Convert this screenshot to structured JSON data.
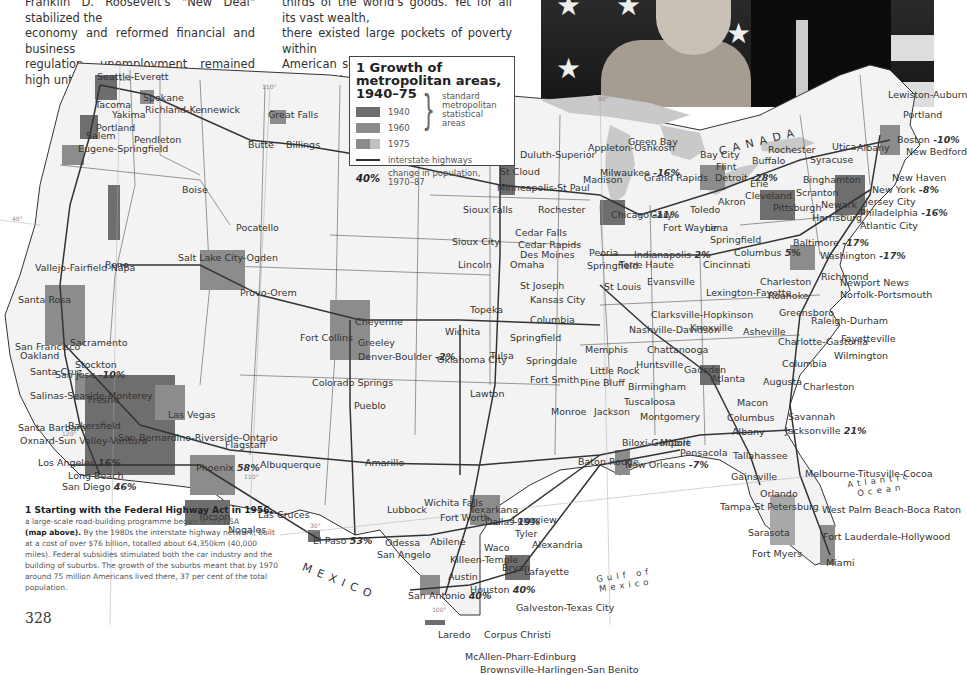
{
  "body_text": {
    "col1": [
      "Franklin D. Roosevelt's \"New Deal\" stabilized the",
      "economy and reformed financial and business",
      "regulation, unemployment remained high until the"
    ],
    "col2": [
      "thirds of the world's goods. Yet for all its vast wealth,",
      "there existed large pockets of poverty within",
      "American society itself. While much of this poverty"
    ]
  },
  "photo": {
    "description": "Couple waving in front of star-spangled flag"
  },
  "legend": {
    "title": "1 Growth of metropolitan areas, 1940–75",
    "items": [
      {
        "label": "1940",
        "color": "#6e6e6e"
      },
      {
        "label": "1960",
        "color": "#8c8c8c"
      },
      {
        "label": "1975",
        "color": "#a8a8a8"
      }
    ],
    "group_label": "standard metropolitan statistical areas",
    "highway_label": "interstate highways",
    "pct_symbol": "40%",
    "pct_label": "change in population, 1970–87"
  },
  "map": {
    "countries": {
      "canada": "CANADA",
      "mexico": "MEXICO"
    },
    "seas": {
      "atlantic": "Atlantic Ocean",
      "gulf": "Gulf of Mexico"
    },
    "meridians": [
      "120°",
      "110°",
      "90°",
      "70°",
      "40°",
      "30°",
      "100°"
    ],
    "cities": [
      {
        "name": "Seattle-Everett",
        "x": 97,
        "y": 17
      },
      {
        "name": "Spokane",
        "x": 143,
        "y": 38
      },
      {
        "name": "Great Falls",
        "x": 268,
        "y": 55
      },
      {
        "name": "Tacoma",
        "x": 95,
        "y": 45
      },
      {
        "name": "Yakima",
        "x": 112,
        "y": 55
      },
      {
        "name": "Richland-Kennewick",
        "x": 145,
        "y": 50
      },
      {
        "name": "Portland",
        "x": 96,
        "y": 68
      },
      {
        "name": "Salem",
        "x": 86,
        "y": 76
      },
      {
        "name": "Pendleton",
        "x": 134,
        "y": 80
      },
      {
        "name": "Butte",
        "x": 248,
        "y": 85
      },
      {
        "name": "Billings",
        "x": 286,
        "y": 85
      },
      {
        "name": "Eugene-Springfield",
        "x": 78,
        "y": 89
      },
      {
        "name": "Boise",
        "x": 182,
        "y": 130
      },
      {
        "name": "Pocatello",
        "x": 236,
        "y": 168
      },
      {
        "name": "Reno",
        "x": 105,
        "y": 205
      },
      {
        "name": "Vallejo-Fairfield-Napa",
        "x": 35,
        "y": 208
      },
      {
        "name": "Salt Lake City-Ogden",
        "x": 178,
        "y": 198
      },
      {
        "name": "Provo-Orem",
        "x": 240,
        "y": 233
      },
      {
        "name": "Santa Rosa",
        "x": 18,
        "y": 240
      },
      {
        "name": "San Francisco",
        "x": 15,
        "y": 287
      },
      {
        "name": "Sacramento",
        "x": 70,
        "y": 283
      },
      {
        "name": "Oakland",
        "x": 20,
        "y": 296
      },
      {
        "name": "Stockton",
        "x": 75,
        "y": 305
      },
      {
        "name": "Santa Cruz",
        "x": 30,
        "y": 312
      },
      {
        "name": "San Jose",
        "x": 55,
        "y": 315,
        "pct": "-10%"
      },
      {
        "name": "Fresno",
        "x": 88,
        "y": 340
      },
      {
        "name": "Salinas-Seaside-Monterey",
        "x": 30,
        "y": 336
      },
      {
        "name": "Las Vegas",
        "x": 168,
        "y": 355
      },
      {
        "name": "Bakersfield",
        "x": 68,
        "y": 366
      },
      {
        "name": "Santa Barbara",
        "x": 18,
        "y": 368
      },
      {
        "name": "Oxnard-Sun Valley-Ventura",
        "x": 20,
        "y": 381
      },
      {
        "name": "San Bernardino-Riverside-Ontario",
        "x": 118,
        "y": 378
      },
      {
        "name": "Los Angeles",
        "x": 38,
        "y": 403,
        "pct": "16%"
      },
      {
        "name": "Long Beach",
        "x": 68,
        "y": 416
      },
      {
        "name": "San Diego",
        "x": 62,
        "y": 427,
        "pct": "46%"
      },
      {
        "name": "Flagstaff",
        "x": 225,
        "y": 385
      },
      {
        "name": "Albuquerque",
        "x": 260,
        "y": 405
      },
      {
        "name": "Phoenix",
        "x": 196,
        "y": 408,
        "pct": "58%"
      },
      {
        "name": "Tucson",
        "x": 198,
        "y": 457
      },
      {
        "name": "Nogales",
        "x": 228,
        "y": 470
      },
      {
        "name": "Las Cruces",
        "x": 258,
        "y": 455
      },
      {
        "name": "El Paso",
        "x": 313,
        "y": 481,
        "pct": "53%"
      },
      {
        "name": "Cheyenne",
        "x": 355,
        "y": 262
      },
      {
        "name": "Fort Collins",
        "x": 300,
        "y": 278
      },
      {
        "name": "Greeley",
        "x": 358,
        "y": 283
      },
      {
        "name": "Denver-Boulder",
        "x": 358,
        "y": 297,
        "pct": "-2%"
      },
      {
        "name": "Colorado Springs",
        "x": 312,
        "y": 323
      },
      {
        "name": "Pueblo",
        "x": 354,
        "y": 346
      },
      {
        "name": "Amarillo",
        "x": 365,
        "y": 403
      },
      {
        "name": "Lubbock",
        "x": 387,
        "y": 450
      },
      {
        "name": "Wichita Falls",
        "x": 424,
        "y": 443
      },
      {
        "name": "Odessa",
        "x": 385,
        "y": 483
      },
      {
        "name": "San Angelo",
        "x": 377,
        "y": 495
      },
      {
        "name": "Abilene",
        "x": 430,
        "y": 482
      },
      {
        "name": "Fort Worth",
        "x": 440,
        "y": 458
      },
      {
        "name": "Dallas",
        "x": 485,
        "y": 462,
        "pct": "19%"
      },
      {
        "name": "Texarkana",
        "x": 470,
        "y": 450
      },
      {
        "name": "Longview",
        "x": 512,
        "y": 460
      },
      {
        "name": "Tyler",
        "x": 515,
        "y": 474
      },
      {
        "name": "Waco",
        "x": 484,
        "y": 488
      },
      {
        "name": "Killeen-Temple",
        "x": 450,
        "y": 500
      },
      {
        "name": "Bryan",
        "x": 502,
        "y": 508
      },
      {
        "name": "Austin",
        "x": 448,
        "y": 517
      },
      {
        "name": "Alexandria",
        "x": 532,
        "y": 485
      },
      {
        "name": "Lafayette",
        "x": 524,
        "y": 512
      },
      {
        "name": "San Antonio",
        "x": 408,
        "y": 536,
        "pct": "40%"
      },
      {
        "name": "Houston",
        "x": 470,
        "y": 530,
        "pct": "40%"
      },
      {
        "name": "Galveston-Texas City",
        "x": 516,
        "y": 548
      },
      {
        "name": "Laredo",
        "x": 438,
        "y": 575
      },
      {
        "name": "Corpus Christi",
        "x": 484,
        "y": 575
      },
      {
        "name": "McAllen-Pharr-Edinburg",
        "x": 465,
        "y": 597
      },
      {
        "name": "Brownsville-Harlingen-San Benito",
        "x": 480,
        "y": 610
      },
      {
        "name": "Duluth-Superior",
        "x": 520,
        "y": 95
      },
      {
        "name": "St Cloud",
        "x": 500,
        "y": 112
      },
      {
        "name": "Minneapolis-St Paul",
        "x": 497,
        "y": 128
      },
      {
        "name": "Sioux Falls",
        "x": 463,
        "y": 150
      },
      {
        "name": "Rochester",
        "x": 538,
        "y": 150
      },
      {
        "name": "Cedar Falls",
        "x": 515,
        "y": 173
      },
      {
        "name": "Cedar Rapids",
        "x": 518,
        "y": 185
      },
      {
        "name": "Sioux City",
        "x": 452,
        "y": 182
      },
      {
        "name": "Des Moines",
        "x": 520,
        "y": 195
      },
      {
        "name": "Lincoln",
        "x": 458,
        "y": 205
      },
      {
        "name": "Omaha",
        "x": 510,
        "y": 205
      },
      {
        "name": "St Joseph",
        "x": 520,
        "y": 226
      },
      {
        "name": "Kansas City",
        "x": 530,
        "y": 240
      },
      {
        "name": "Topeka",
        "x": 470,
        "y": 250
      },
      {
        "name": "Columbia",
        "x": 530,
        "y": 260
      },
      {
        "name": "Wichita",
        "x": 445,
        "y": 272
      },
      {
        "name": "Springfield",
        "x": 510,
        "y": 278
      },
      {
        "name": "Tulsa",
        "x": 490,
        "y": 296
      },
      {
        "name": "Oklahoma City",
        "x": 437,
        "y": 300
      },
      {
        "name": "Springdale",
        "x": 526,
        "y": 301
      },
      {
        "name": "Fort Smith",
        "x": 530,
        "y": 320
      },
      {
        "name": "Lawton",
        "x": 470,
        "y": 334
      },
      {
        "name": "Appleton-Oshkosh",
        "x": 588,
        "y": 88
      },
      {
        "name": "Green Bay",
        "x": 628,
        "y": 82
      },
      {
        "name": "Milwaukee",
        "x": 600,
        "y": 113,
        "pct": "-16%"
      },
      {
        "name": "Madison",
        "x": 583,
        "y": 120
      },
      {
        "name": "Grand Rapids",
        "x": 644,
        "y": 118
      },
      {
        "name": "Bay City",
        "x": 700,
        "y": 95
      },
      {
        "name": "Flint",
        "x": 716,
        "y": 107
      },
      {
        "name": "Detroit",
        "x": 715,
        "y": 118,
        "pct": "-28%"
      },
      {
        "name": "Buffalo",
        "x": 752,
        "y": 101
      },
      {
        "name": "Rochester",
        "x": 768,
        "y": 90
      },
      {
        "name": "Syracuse",
        "x": 810,
        "y": 100
      },
      {
        "name": "Binghamton",
        "x": 803,
        "y": 120
      },
      {
        "name": "Utica",
        "x": 832,
        "y": 87
      },
      {
        "name": "Albany",
        "x": 857,
        "y": 88
      },
      {
        "name": "Lewiston-Auburn",
        "x": 888,
        "y": 35
      },
      {
        "name": "Portland",
        "x": 903,
        "y": 55
      },
      {
        "name": "Boston",
        "x": 897,
        "y": 80,
        "pct": "-10%"
      },
      {
        "name": "New Bedford",
        "x": 906,
        "y": 92
      },
      {
        "name": "New Haven",
        "x": 892,
        "y": 118
      },
      {
        "name": "New York",
        "x": 872,
        "y": 130,
        "pct": "-8%"
      },
      {
        "name": "Jersey City",
        "x": 865,
        "y": 142
      },
      {
        "name": "Philadelphia",
        "x": 860,
        "y": 153,
        "pct": "-16%"
      },
      {
        "name": "Atlantic City",
        "x": 860,
        "y": 166
      },
      {
        "name": "Scranton",
        "x": 796,
        "y": 133
      },
      {
        "name": "Erie",
        "x": 750,
        "y": 124
      },
      {
        "name": "Newark",
        "x": 821,
        "y": 145
      },
      {
        "name": "Harrisburg",
        "x": 812,
        "y": 158
      },
      {
        "name": "Pittsburgh",
        "x": 773,
        "y": 148
      },
      {
        "name": "Cleveland",
        "x": 745,
        "y": 136
      },
      {
        "name": "Akron",
        "x": 718,
        "y": 142
      },
      {
        "name": "Toledo",
        "x": 690,
        "y": 150
      },
      {
        "name": "Chicago",
        "x": 611,
        "y": 155,
        "pct": "-11%"
      },
      {
        "name": "Gary",
        "x": 650,
        "y": 155
      },
      {
        "name": "Fort Wayne",
        "x": 663,
        "y": 168
      },
      {
        "name": "Lima",
        "x": 705,
        "y": 168
      },
      {
        "name": "Springfield",
        "x": 710,
        "y": 180
      },
      {
        "name": "Columbus",
        "x": 734,
        "y": 193,
        "pct": "5%"
      },
      {
        "name": "Cincinnati",
        "x": 703,
        "y": 205
      },
      {
        "name": "Indianapolis",
        "x": 634,
        "y": 195,
        "pct": "2%"
      },
      {
        "name": "Peoria",
        "x": 589,
        "y": 193
      },
      {
        "name": "Springfield",
        "x": 587,
        "y": 206
      },
      {
        "name": "Terre Haute",
        "x": 619,
        "y": 205
      },
      {
        "name": "Baltimore",
        "x": 793,
        "y": 183,
        "pct": "-17%"
      },
      {
        "name": "Washington",
        "x": 820,
        "y": 196,
        "pct": "-17%"
      },
      {
        "name": "Richmond",
        "x": 821,
        "y": 217
      },
      {
        "name": "Newport News",
        "x": 840,
        "y": 223
      },
      {
        "name": "Norfolk-Portsmouth",
        "x": 840,
        "y": 235
      },
      {
        "name": "Charleston",
        "x": 760,
        "y": 222
      },
      {
        "name": "St Louis",
        "x": 604,
        "y": 227
      },
      {
        "name": "Evansville",
        "x": 647,
        "y": 222
      },
      {
        "name": "Lexington-Fayette",
        "x": 706,
        "y": 233
      },
      {
        "name": "Roanoke",
        "x": 768,
        "y": 236
      },
      {
        "name": "Clarksville-Hopkinson",
        "x": 651,
        "y": 255
      },
      {
        "name": "Greensboro",
        "x": 779,
        "y": 253
      },
      {
        "name": "Raleigh-Durham",
        "x": 811,
        "y": 261
      },
      {
        "name": "Fayetteville",
        "x": 841,
        "y": 279
      },
      {
        "name": "Nashville-Davidson",
        "x": 629,
        "y": 270
      },
      {
        "name": "Knoxville",
        "x": 690,
        "y": 268
      },
      {
        "name": "Asheville",
        "x": 743,
        "y": 272
      },
      {
        "name": "Charlotte-Gastonia",
        "x": 778,
        "y": 282
      },
      {
        "name": "Wilmington",
        "x": 834,
        "y": 296
      },
      {
        "name": "Memphis",
        "x": 585,
        "y": 290
      },
      {
        "name": "Chattanooga",
        "x": 647,
        "y": 290
      },
      {
        "name": "Huntsville",
        "x": 636,
        "y": 305
      },
      {
        "name": "Gadsden",
        "x": 684,
        "y": 310
      },
      {
        "name": "Atlanta",
        "x": 711,
        "y": 319
      },
      {
        "name": "Augusta",
        "x": 763,
        "y": 322
      },
      {
        "name": "Columbia",
        "x": 782,
        "y": 304
      },
      {
        "name": "Charleston",
        "x": 803,
        "y": 327
      },
      {
        "name": "Little Rock",
        "x": 590,
        "y": 311
      },
      {
        "name": "Pine Bluff",
        "x": 580,
        "y": 323
      },
      {
        "name": "Birmingham",
        "x": 628,
        "y": 327
      },
      {
        "name": "Tuscaloosa",
        "x": 624,
        "y": 342
      },
      {
        "name": "Macon",
        "x": 737,
        "y": 343
      },
      {
        "name": "Monroe",
        "x": 551,
        "y": 352
      },
      {
        "name": "Jackson",
        "x": 594,
        "y": 352
      },
      {
        "name": "Montgomery",
        "x": 640,
        "y": 357
      },
      {
        "name": "Columbus",
        "x": 727,
        "y": 358
      },
      {
        "name": "Savannah",
        "x": 788,
        "y": 357
      },
      {
        "name": "Albany",
        "x": 732,
        "y": 372
      },
      {
        "name": "Jacksonville",
        "x": 785,
        "y": 371,
        "pct": "21%"
      },
      {
        "name": "Biloxi-Gulfport",
        "x": 622,
        "y": 383
      },
      {
        "name": "Mobile",
        "x": 660,
        "y": 383
      },
      {
        "name": "Pensacola",
        "x": 680,
        "y": 393
      },
      {
        "name": "Tallahassee",
        "x": 733,
        "y": 396
      },
      {
        "name": "Baton Rouge",
        "x": 578,
        "y": 402
      },
      {
        "name": "New Orleans",
        "x": 625,
        "y": 405,
        "pct": "-7%"
      },
      {
        "name": "Gainsville",
        "x": 731,
        "y": 417
      },
      {
        "name": "Melbourne-Titusville-Cocoa",
        "x": 805,
        "y": 414
      },
      {
        "name": "Orlando",
        "x": 760,
        "y": 434
      },
      {
        "name": "Tampa-St Petersburg",
        "x": 720,
        "y": 447
      },
      {
        "name": "West Palm Beach-Boca Raton",
        "x": 822,
        "y": 450
      },
      {
        "name": "Sarasota",
        "x": 748,
        "y": 473
      },
      {
        "name": "Fort Lauderdale-Hollywood",
        "x": 823,
        "y": 477
      },
      {
        "name": "Fort Myers",
        "x": 752,
        "y": 494
      },
      {
        "name": "Miami",
        "x": 826,
        "y": 503
      }
    ]
  },
  "caption": {
    "head": "1 Starting with the Federal Highway Act in 1956,",
    "line1": "a large-scale road-building programme began in the USA",
    "ref": "(map above).",
    "rest": "By the 1980s the interstate highway network, built at a cost of over $76 billion, totalled about 64,350km (40,000 miles). Federal subsidies stimulated both the car industry and the building of suburbs. The growth of the suburbs meant that by 1970 around 75 million Americans lived there, 37 per cent of the total population."
  },
  "page_number": "328"
}
